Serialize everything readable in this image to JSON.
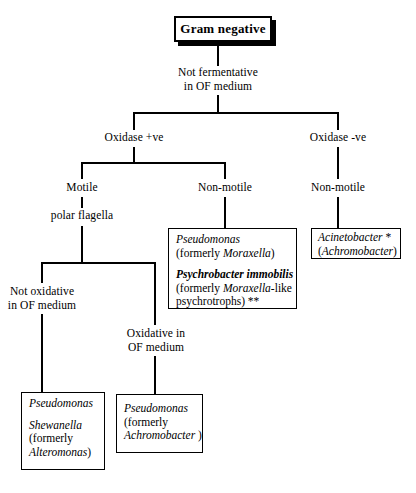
{
  "diagram": {
    "root": {
      "label": "Gram negative"
    },
    "nodes": {
      "not_fermentative": {
        "line1": "Not fermentative",
        "line2": "in OF medium"
      },
      "oxidase_pos": {
        "label": "Oxidase +ve"
      },
      "oxidase_neg": {
        "label": "Oxidase -ve"
      },
      "motile": {
        "label": "Motile"
      },
      "polar_flagella": {
        "label": "polar flagella"
      },
      "non_motile_left": {
        "label": "Non-motile"
      },
      "non_motile_right": {
        "label": "Non-motile"
      },
      "not_oxidative": {
        "line1": "Not oxidative",
        "line2": "in OF medium"
      },
      "oxidative": {
        "line1": "Oxidative in",
        "line2": "OF medium"
      }
    },
    "boxes": {
      "pseudomonas_psychrobacter": {
        "l1_italic": "Pseudomonas",
        "l2_a": "(formerly ",
        "l2_italic": "Moraxella",
        "l2_b": ")",
        "l3_bolditalic": "Psychrobacter immobilis",
        "l4_a": "(formerly ",
        "l4_italic": "Moraxella",
        "l4_b": "-like",
        "l5": "psychrotrophs) **"
      },
      "acinetobacter": {
        "l1_italic": "Acinetobacter",
        "l1_b": " *",
        "l2_a": "(",
        "l2_italic": "Achromobacter",
        "l2_b": ")"
      },
      "pseudomonas_shewanella": {
        "l1_italic": "Pseudomonas",
        "l2_italic": "Shewanella",
        "l3": "(formerly",
        "l4_italic": "Alteromonas",
        "l4_b": ")"
      },
      "pseudomonas_achromobacter": {
        "l1_italic": "Pseudomonas",
        "l2": "(formerly",
        "l3_italic": "Achromobacter",
        "l3_b": " )"
      }
    },
    "colors": {
      "line": "#000000",
      "background": "#ffffff",
      "text": "#000000"
    }
  }
}
